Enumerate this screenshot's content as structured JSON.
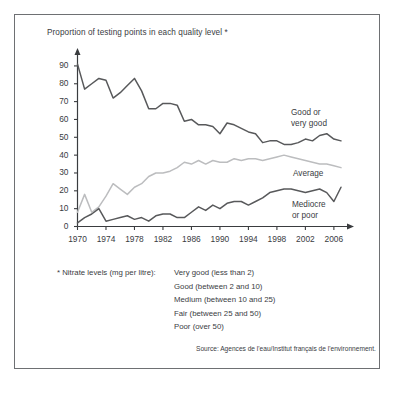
{
  "chart_title": "Proportion of testing points in each quality level *",
  "axes": {
    "y_ticks": [
      0,
      10,
      20,
      30,
      40,
      50,
      60,
      70,
      80,
      90
    ],
    "x_ticks": [
      1970,
      1974,
      1978,
      1982,
      1986,
      1990,
      1994,
      1998,
      2002,
      2006
    ],
    "xlim": [
      1970,
      2007
    ],
    "ylim": [
      0,
      95
    ]
  },
  "series_labels": {
    "good": "Good or\nvery good",
    "good_line1": "Good or",
    "good_line2": "very good",
    "average": "Average",
    "mediocre_line1": "Mediocre",
    "mediocre_line2": "or poor"
  },
  "footnote": {
    "head": "* Nitrate levels (mg per litre):",
    "items": [
      "Very good (less than 2)",
      "Good (between 2 and 10)",
      "Medium (between 10 and 25)",
      "Fair (between 25 and 50)",
      "Poor (over 50)"
    ]
  },
  "source": "Source: Agences de l'eau/Institut français de l'environnement.",
  "colors": {
    "good": "#58595b",
    "average": "#bcbdbf",
    "mediocre": "#58595b",
    "frame": "#6e7073",
    "text": "#3a3c3f",
    "axis": "#3a3c3f"
  },
  "chart_data": {
    "type": "line",
    "title": "Proportion of testing points in each quality level *",
    "xlabel": "",
    "ylabel": "",
    "xlim": [
      1970,
      2007
    ],
    "ylim": [
      0,
      95
    ],
    "grid": false,
    "legend": "inline-annotations",
    "x": [
      1970,
      1971,
      1972,
      1973,
      1974,
      1975,
      1976,
      1977,
      1978,
      1979,
      1980,
      1981,
      1982,
      1983,
      1984,
      1985,
      1986,
      1987,
      1988,
      1989,
      1990,
      1991,
      1992,
      1993,
      1994,
      1995,
      1996,
      1997,
      1998,
      1999,
      2000,
      2001,
      2002,
      2003,
      2004,
      2005,
      2006,
      2007
    ],
    "series": [
      {
        "name": "Good or very good",
        "color": "#58595b",
        "values": [
          91,
          77,
          80,
          83,
          82,
          72,
          75,
          79,
          83,
          76,
          66,
          66,
          69,
          69,
          68,
          59,
          60,
          57,
          57,
          56,
          52,
          58,
          57,
          55,
          53,
          52,
          47,
          48,
          48,
          46,
          46,
          47,
          49,
          48,
          51,
          52,
          49,
          48
        ]
      },
      {
        "name": "Average",
        "color": "#bcbdbf",
        "values": [
          8,
          18,
          8,
          11,
          17,
          24,
          21,
          18,
          22,
          24,
          28,
          30,
          30,
          31,
          33,
          36,
          35,
          37,
          35,
          37,
          36,
          36,
          38,
          37,
          38,
          38,
          37,
          38,
          39,
          40,
          39,
          38,
          37,
          36,
          35,
          35,
          34,
          33
        ]
      },
      {
        "name": "Mediocre or poor",
        "color": "#58595b",
        "values": [
          2,
          5,
          7,
          10,
          3,
          4,
          5,
          6,
          4,
          5,
          3,
          6,
          7,
          7,
          5,
          5,
          8,
          11,
          9,
          12,
          10,
          13,
          14,
          14,
          12,
          14,
          16,
          19,
          20,
          21,
          21,
          20,
          19,
          20,
          21,
          19,
          14,
          22
        ]
      }
    ]
  }
}
